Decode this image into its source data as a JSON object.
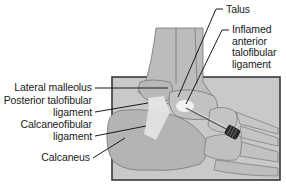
{
  "diagram": {
    "colors": {
      "background": "#ffffff",
      "panel_fill": "#c9c9c9",
      "panel_border": "#3a3a3a",
      "bone_fill": "#bdbdbd",
      "bone_outline": "#6e6e6e",
      "ligament_fill": "#e6e6e6",
      "inflamed_highlight": "#f2f2f2",
      "leader_line": "#1a1a1a",
      "label_text": "#1a1a1a"
    },
    "labels": {
      "talus": "Talus",
      "inflamed_atfl": [
        "Inflamed",
        "anterior",
        "talofibular",
        "ligament"
      ],
      "lateral_malleolus": "Lateral malleolus",
      "posterior_tfl": [
        "Posterior talofibular",
        "ligament"
      ],
      "calcaneofibular": [
        "Calcaneofibular",
        "ligament"
      ],
      "calcaneus": "Calcaneus"
    },
    "instrument": {
      "name": "injection-needle-syringe"
    }
  }
}
